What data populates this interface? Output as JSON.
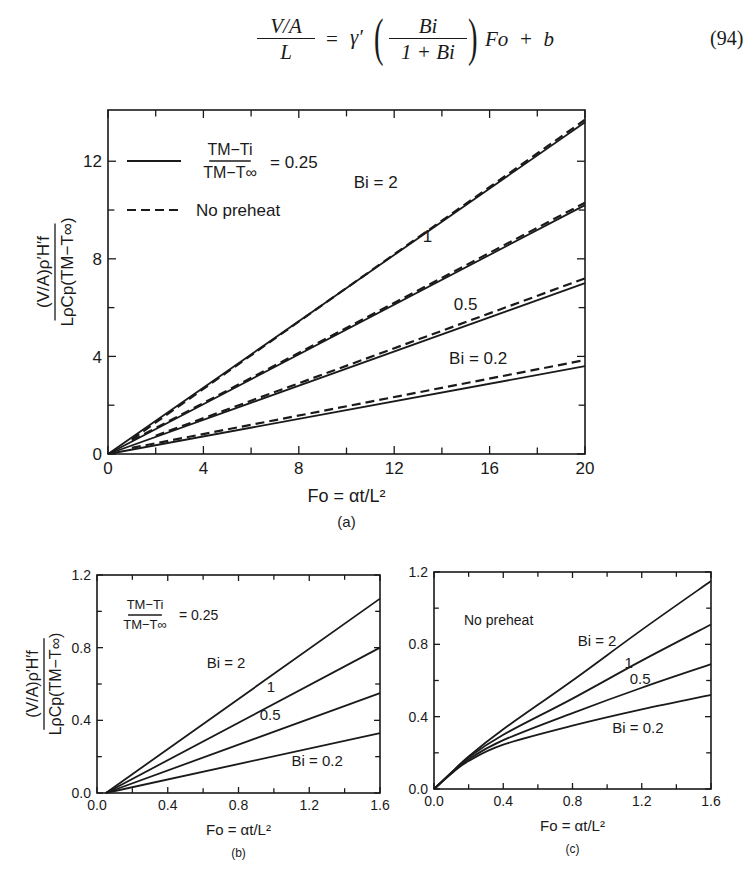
{
  "equation": {
    "lhs_numerator": "V/A",
    "lhs_denominator": "L",
    "equals": "=",
    "gamma": "γ′",
    "frac_numerator": "Bi",
    "frac_denominator": "1 + Bi",
    "tail": "Fo  +  b",
    "number": "(94)"
  },
  "ylabel": {
    "numerator": "(V/A)ρ′H′f",
    "denominator": "LρCp(TM−T∞)"
  },
  "chart_data": [
    {
      "id": "a",
      "type": "line",
      "caption": "(a)",
      "xlabel": "Fo = αt/L²",
      "ylabel": "(V/A)ρ′H′f / LρCp(TM−T∞)",
      "xlim": [
        0,
        20
      ],
      "ylim": [
        0,
        14.1
      ],
      "xticks": [
        0,
        4,
        8,
        12,
        16,
        20
      ],
      "xminor": [
        2,
        6,
        10,
        14,
        18
      ],
      "yticks": [
        0,
        4,
        8,
        12
      ],
      "yminor": [
        2,
        6,
        10
      ],
      "legend": [
        {
          "style": "solid",
          "label": "(TM−Ti)/(TM−T∞) = 0.25"
        },
        {
          "style": "dashed",
          "label": "No preheat"
        }
      ],
      "series": [
        {
          "name": "Bi=2, (TM−Ti)/(TM−T∞)=0.25",
          "style": "solid",
          "x": [
            0,
            20
          ],
          "y": [
            0,
            13.6
          ]
        },
        {
          "name": "Bi=2, No preheat",
          "style": "dashed",
          "x": [
            1,
            20
          ],
          "y": [
            0.6,
            13.7
          ]
        },
        {
          "name": "Bi=1, (TM−Ti)/(TM−T∞)=0.25",
          "style": "solid",
          "x": [
            0,
            20
          ],
          "y": [
            0,
            10.2
          ]
        },
        {
          "name": "Bi=1, No preheat",
          "style": "dashed",
          "x": [
            1,
            20
          ],
          "y": [
            0.55,
            10.3
          ]
        },
        {
          "name": "Bi=0.5, (TM−Ti)/(TM−T∞)=0.25",
          "style": "solid",
          "x": [
            0,
            20
          ],
          "y": [
            0,
            7.0
          ]
        },
        {
          "name": "Bi=0.5, No preheat",
          "style": "dashed",
          "x": [
            2,
            20
          ],
          "y": [
            0.75,
            7.2
          ]
        },
        {
          "name": "Bi=0.2, (TM−Ti)/(TM−T∞)=0.25",
          "style": "solid",
          "x": [
            0,
            20
          ],
          "y": [
            0,
            3.6
          ]
        },
        {
          "name": "Bi=0.2, No preheat",
          "style": "dashed",
          "x": [
            1,
            20
          ],
          "y": [
            0.25,
            3.85
          ]
        }
      ],
      "annotations": [
        {
          "text": "Bi = 2",
          "x": 10.3,
          "y": 10.9
        },
        {
          "text": "1",
          "x": 13.2,
          "y": 8.7
        },
        {
          "text": "0.5",
          "x": 14.5,
          "y": 5.9
        },
        {
          "text": "Bi = 0.2",
          "x": 14.3,
          "y": 3.7
        }
      ]
    },
    {
      "id": "b",
      "type": "line",
      "caption": "(b)",
      "xlabel": "Fo = αt/L²",
      "ylabel": "(V/A)ρ′H′f / LρCp(TM−T∞)",
      "xlim": [
        0,
        1.6
      ],
      "ylim": [
        0,
        1.2
      ],
      "xticks": [
        0.0,
        0.4,
        0.8,
        1.2,
        1.6
      ],
      "xtick_labels": [
        "0.0",
        "0.4",
        "0.8",
        "1.2",
        "1.6"
      ],
      "xminor": [
        0.2,
        0.6,
        1.0,
        1.4
      ],
      "yticks": [
        0.0,
        0.4,
        0.8,
        1.2
      ],
      "ytick_labels": [
        "0.0",
        "0.4",
        "0.8",
        "1.2"
      ],
      "yminor": [
        0.2,
        0.6,
        1.0
      ],
      "inset_label": "(TM−Ti)/(TM−T∞) = 0.25",
      "series": [
        {
          "name": "Bi=2",
          "style": "solid",
          "x": [
            0.05,
            1.6
          ],
          "y": [
            0,
            1.07
          ]
        },
        {
          "name": "Bi=1",
          "style": "solid",
          "x": [
            0.05,
            1.6
          ],
          "y": [
            0,
            0.8
          ]
        },
        {
          "name": "Bi=0.5",
          "style": "solid",
          "x": [
            0.05,
            1.6
          ],
          "y": [
            0,
            0.55
          ]
        },
        {
          "name": "Bi=0.2",
          "style": "solid",
          "x": [
            0.05,
            1.6
          ],
          "y": [
            0,
            0.33
          ]
        }
      ],
      "annotations": [
        {
          "text": "Bi = 2",
          "x": 0.62,
          "y": 0.69
        },
        {
          "text": "1",
          "x": 0.96,
          "y": 0.555
        },
        {
          "text": "0.5",
          "x": 0.92,
          "y": 0.4
        },
        {
          "text": "Bi = 0.2",
          "x": 1.1,
          "y": 0.15
        }
      ]
    },
    {
      "id": "c",
      "type": "line",
      "caption": "(c)",
      "xlabel": "Fo = αt/L²",
      "xlim": [
        0,
        1.6
      ],
      "ylim": [
        0,
        1.2
      ],
      "xticks": [
        0.0,
        0.4,
        0.8,
        1.2,
        1.6
      ],
      "xtick_labels": [
        "0.0",
        "0.4",
        "0.8",
        "1.2",
        "1.6"
      ],
      "xminor": [
        0.2,
        0.6,
        1.0,
        1.4
      ],
      "yticks": [
        0.0,
        0.4,
        0.8,
        1.2
      ],
      "ytick_labels": [
        "0.0",
        "0.4",
        "0.8",
        "1.2"
      ],
      "yminor": [
        0.2,
        0.6,
        1.0
      ],
      "inset_label": "No preheat",
      "series": [
        {
          "name": "Bi=2",
          "style": "solid",
          "x": [
            0,
            0.1,
            0.2,
            0.4,
            0.8,
            1.2,
            1.6
          ],
          "y": [
            0,
            0.09,
            0.18,
            0.33,
            0.6,
            0.88,
            1.15
          ]
        },
        {
          "name": "Bi=1",
          "style": "solid",
          "x": [
            0,
            0.1,
            0.2,
            0.4,
            0.8,
            1.2,
            1.6
          ],
          "y": [
            0,
            0.09,
            0.175,
            0.3,
            0.5,
            0.71,
            0.91
          ]
        },
        {
          "name": "Bi=0.5",
          "style": "solid",
          "x": [
            0,
            0.1,
            0.2,
            0.4,
            0.8,
            1.2,
            1.6
          ],
          "y": [
            0,
            0.085,
            0.165,
            0.27,
            0.42,
            0.56,
            0.69
          ]
        },
        {
          "name": "Bi=0.2",
          "style": "solid",
          "x": [
            0,
            0.1,
            0.2,
            0.4,
            0.8,
            1.2,
            1.6
          ],
          "y": [
            0,
            0.085,
            0.155,
            0.245,
            0.35,
            0.44,
            0.52
          ]
        }
      ],
      "annotations": [
        {
          "text": "Bi = 2",
          "x": 0.83,
          "y": 0.79
        },
        {
          "text": "1",
          "x": 1.1,
          "y": 0.67
        },
        {
          "text": "0.5",
          "x": 1.13,
          "y": 0.58
        },
        {
          "text": "Bi = 0.2",
          "x": 1.03,
          "y": 0.31
        }
      ]
    }
  ]
}
